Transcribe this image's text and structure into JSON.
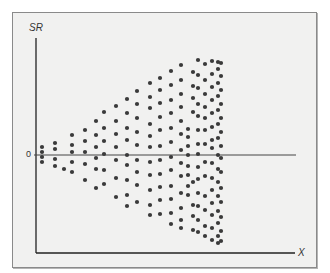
{
  "chart_data": {
    "type": "scatter",
    "title": "",
    "xlabel": "X",
    "ylabel": "SR",
    "y_tick_labels": [
      "0"
    ],
    "zero_line": true,
    "grid": false,
    "legend": null,
    "colors": {
      "dot": "#3a3a3a",
      "axis": "#222222",
      "background": "#f1f1f0"
    },
    "points_px": [
      [
        42,
        147
      ],
      [
        42,
        152
      ],
      [
        42,
        157
      ],
      [
        42,
        162
      ],
      [
        55,
        143
      ],
      [
        55,
        149
      ],
      [
        55,
        159
      ],
      [
        55,
        166
      ],
      [
        64,
        169
      ],
      [
        72,
        135
      ],
      [
        72,
        145
      ],
      [
        72,
        152
      ],
      [
        72,
        162
      ],
      [
        72,
        172
      ],
      [
        85,
        130
      ],
      [
        85,
        141
      ],
      [
        85,
        152
      ],
      [
        85,
        164
      ],
      [
        85,
        180
      ],
      [
        96,
        121
      ],
      [
        96,
        135
      ],
      [
        96,
        147
      ],
      [
        96,
        158
      ],
      [
        96,
        169
      ],
      [
        96,
        188
      ],
      [
        104,
        112
      ],
      [
        104,
        128
      ],
      [
        104,
        141
      ],
      [
        104,
        154
      ],
      [
        104,
        170
      ],
      [
        104,
        184
      ],
      [
        116,
        106
      ],
      [
        116,
        121
      ],
      [
        116,
        134
      ],
      [
        116,
        147
      ],
      [
        116,
        160
      ],
      [
        116,
        178
      ],
      [
        116,
        197
      ],
      [
        127,
        99
      ],
      [
        127,
        113
      ],
      [
        127,
        128
      ],
      [
        127,
        140
      ],
      [
        127,
        155
      ],
      [
        127,
        165
      ],
      [
        127,
        180
      ],
      [
        127,
        195
      ],
      [
        127,
        206
      ],
      [
        137,
        91
      ],
      [
        137,
        104
      ],
      [
        137,
        118
      ],
      [
        137,
        132
      ],
      [
        137,
        145
      ],
      [
        137,
        160
      ],
      [
        137,
        172
      ],
      [
        137,
        185
      ],
      [
        137,
        202
      ],
      [
        150,
        83
      ],
      [
        150,
        97
      ],
      [
        150,
        108
      ],
      [
        150,
        124
      ],
      [
        150,
        136
      ],
      [
        150,
        147
      ],
      [
        150,
        162
      ],
      [
        150,
        175
      ],
      [
        150,
        190
      ],
      [
        150,
        205
      ],
      [
        150,
        215
      ],
      [
        160,
        78
      ],
      [
        160,
        90
      ],
      [
        160,
        103
      ],
      [
        160,
        117
      ],
      [
        160,
        130
      ],
      [
        160,
        146
      ],
      [
        160,
        160
      ],
      [
        160,
        174
      ],
      [
        160,
        187
      ],
      [
        160,
        200
      ],
      [
        160,
        214
      ],
      [
        171,
        71
      ],
      [
        171,
        85
      ],
      [
        171,
        100
      ],
      [
        171,
        113
      ],
      [
        171,
        128
      ],
      [
        171,
        142
      ],
      [
        171,
        157
      ],
      [
        171,
        170
      ],
      [
        171,
        186
      ],
      [
        171,
        199
      ],
      [
        171,
        213
      ],
      [
        171,
        224
      ],
      [
        181,
        65
      ],
      [
        181,
        80
      ],
      [
        181,
        94
      ],
      [
        181,
        107
      ],
      [
        181,
        121
      ],
      [
        181,
        134
      ],
      [
        181,
        150
      ],
      [
        181,
        163
      ],
      [
        181,
        176
      ],
      [
        181,
        193
      ],
      [
        181,
        208
      ],
      [
        181,
        220
      ],
      [
        181,
        228
      ],
      [
        188,
        129
      ],
      [
        188,
        137
      ],
      [
        188,
        146
      ],
      [
        188,
        155
      ],
      [
        188,
        166
      ],
      [
        188,
        175
      ],
      [
        188,
        186
      ],
      [
        188,
        195
      ],
      [
        193,
        72
      ],
      [
        193,
        86
      ],
      [
        193,
        98
      ],
      [
        193,
        112
      ],
      [
        193,
        182
      ],
      [
        193,
        205
      ],
      [
        193,
        216
      ],
      [
        193,
        230
      ],
      [
        198,
        60
      ],
      [
        198,
        75
      ],
      [
        198,
        88
      ],
      [
        198,
        104
      ],
      [
        198,
        116
      ],
      [
        198,
        130
      ],
      [
        198,
        144
      ],
      [
        198,
        154
      ],
      [
        198,
        167
      ],
      [
        198,
        179
      ],
      [
        198,
        193
      ],
      [
        198,
        206
      ],
      [
        198,
        220
      ],
      [
        198,
        232
      ],
      [
        205,
        64
      ],
      [
        205,
        80
      ],
      [
        205,
        94
      ],
      [
        205,
        107
      ],
      [
        205,
        118
      ],
      [
        205,
        130
      ],
      [
        205,
        144
      ],
      [
        205,
        162
      ],
      [
        205,
        176
      ],
      [
        205,
        196
      ],
      [
        205,
        210
      ],
      [
        205,
        226
      ],
      [
        205,
        236
      ],
      [
        212,
        61
      ],
      [
        212,
        74
      ],
      [
        212,
        87
      ],
      [
        212,
        100
      ],
      [
        212,
        113
      ],
      [
        212,
        127
      ],
      [
        212,
        140
      ],
      [
        212,
        148
      ],
      [
        212,
        163
      ],
      [
        212,
        178
      ],
      [
        212,
        190
      ],
      [
        212,
        203
      ],
      [
        212,
        215
      ],
      [
        212,
        228
      ],
      [
        212,
        240
      ],
      [
        218,
        62
      ],
      [
        218,
        69
      ],
      [
        218,
        83
      ],
      [
        218,
        96
      ],
      [
        218,
        110
      ],
      [
        218,
        124
      ],
      [
        218,
        138
      ],
      [
        218,
        155
      ],
      [
        218,
        169
      ],
      [
        218,
        182
      ],
      [
        218,
        196
      ],
      [
        218,
        211
      ],
      [
        218,
        223
      ],
      [
        218,
        236
      ],
      [
        218,
        243
      ],
      [
        221,
        63
      ],
      [
        221,
        76
      ],
      [
        221,
        90
      ],
      [
        221,
        104
      ],
      [
        221,
        118
      ],
      [
        221,
        132
      ],
      [
        221,
        146
      ],
      [
        221,
        158
      ],
      [
        221,
        172
      ],
      [
        221,
        188
      ],
      [
        221,
        202
      ],
      [
        221,
        217
      ],
      [
        221,
        231
      ],
      [
        221,
        241
      ]
    ]
  }
}
